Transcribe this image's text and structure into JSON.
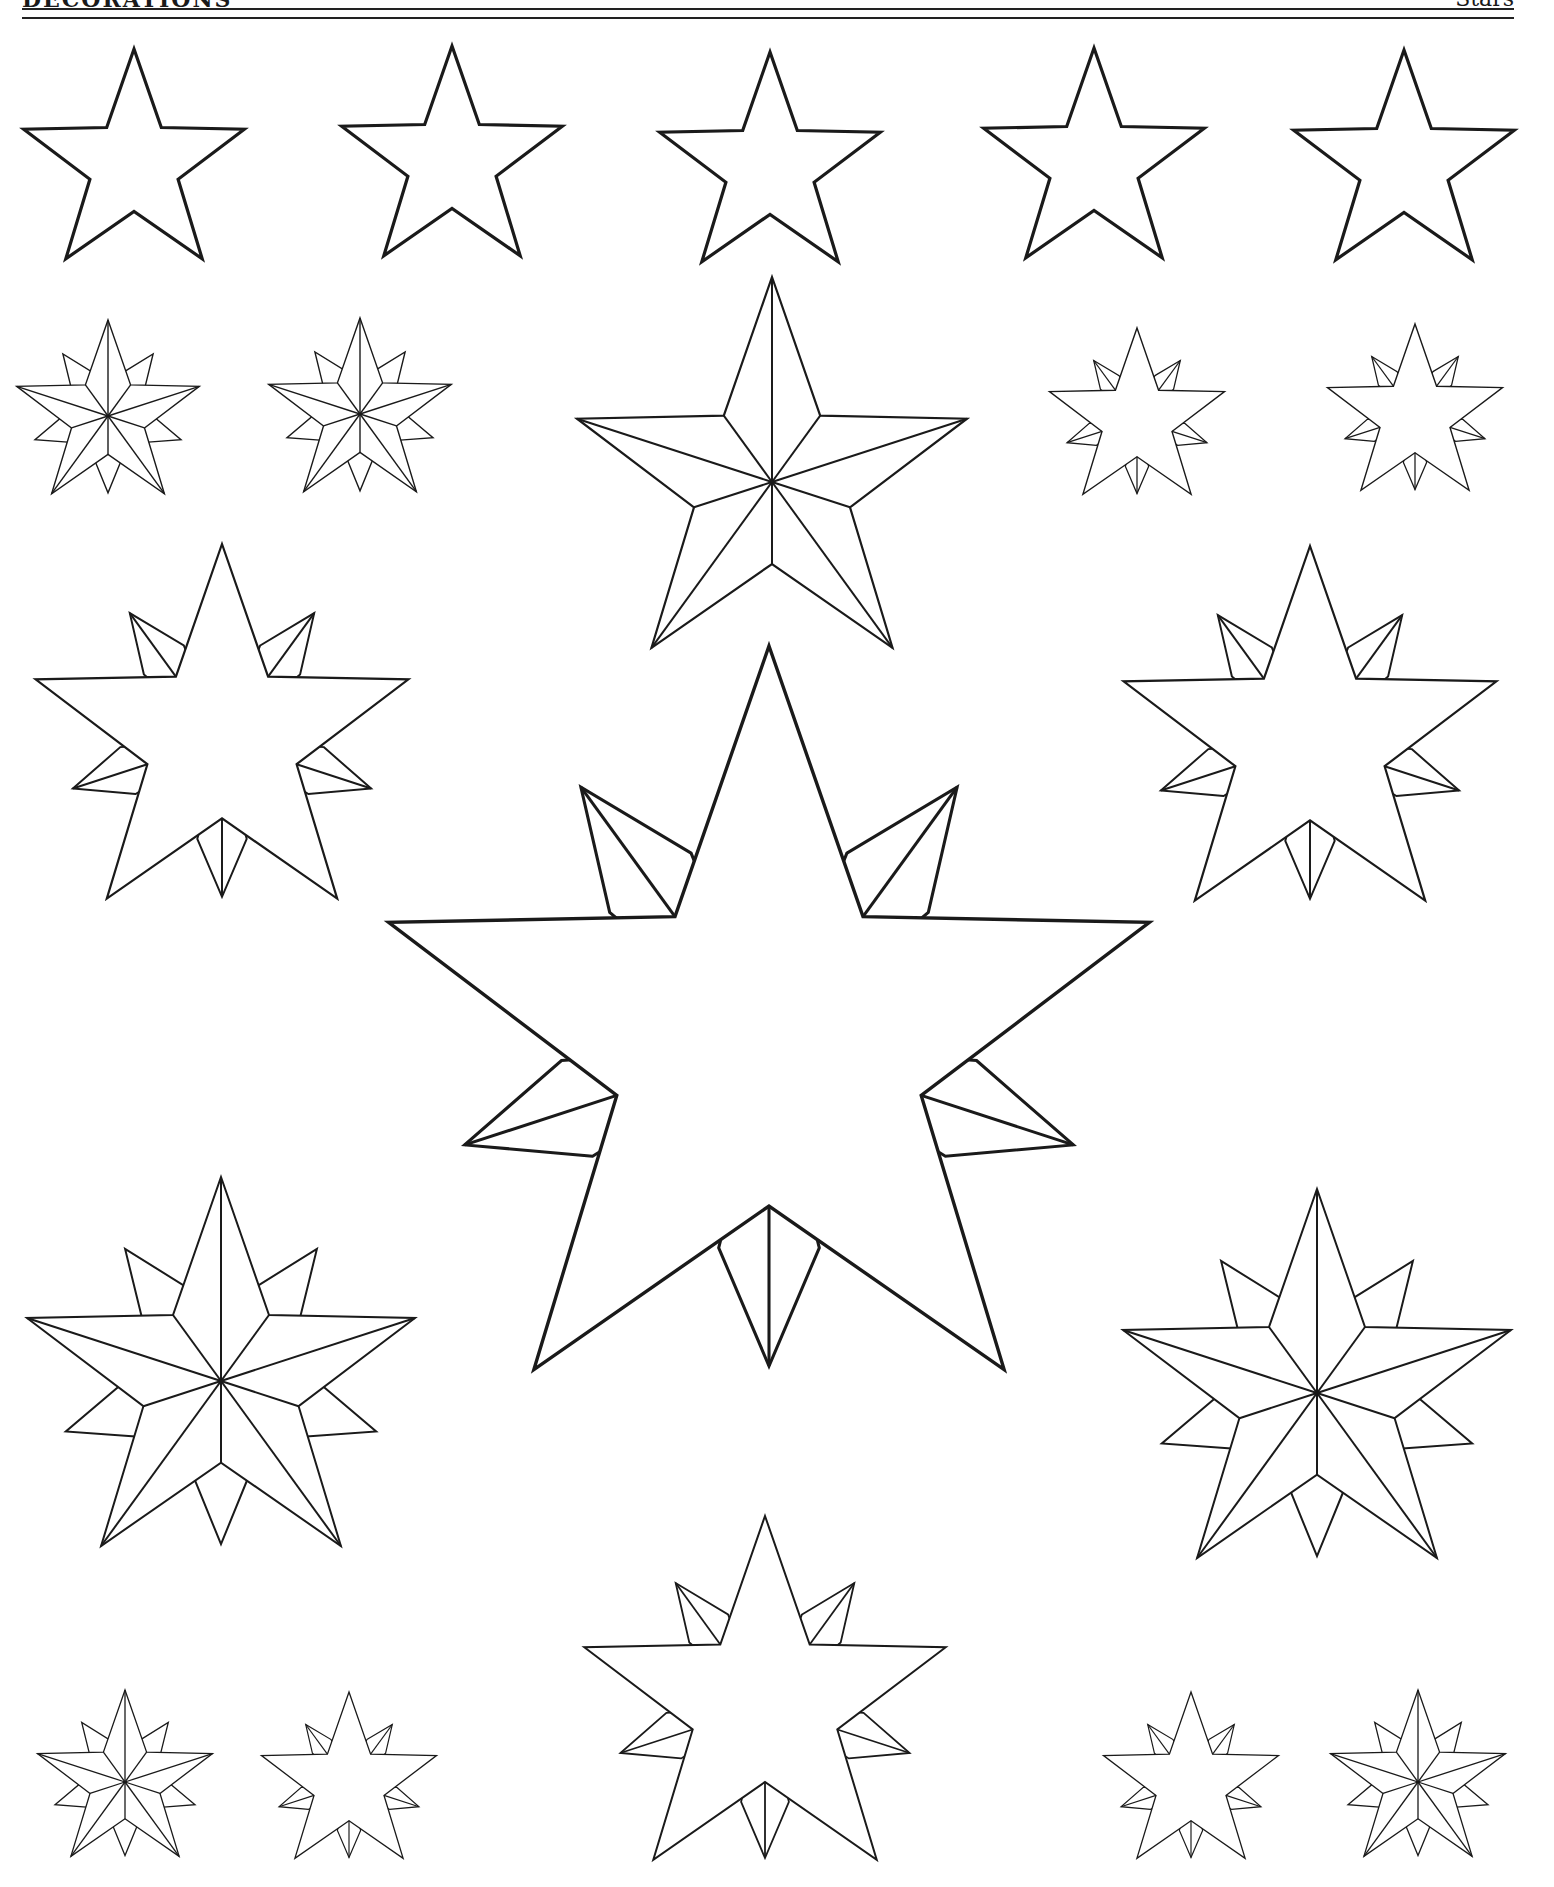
{
  "header": {
    "title": "DECORATIONS",
    "section": "Stars"
  },
  "colors": {
    "ink": "#1a1a1a",
    "paper": "#ffffff"
  },
  "stars": [
    {
      "name": "plain-star-1",
      "type": "plain5",
      "cx": 134,
      "cy": 165,
      "r": 116,
      "stroke": 3.2
    },
    {
      "name": "plain-star-2",
      "type": "plain5",
      "cx": 452,
      "cy": 162,
      "r": 116,
      "stroke": 3.2
    },
    {
      "name": "plain-star-3",
      "type": "plain5",
      "cx": 770,
      "cy": 168,
      "r": 116,
      "stroke": 3.2
    },
    {
      "name": "plain-star-4",
      "type": "plain5",
      "cx": 1094,
      "cy": 164,
      "r": 116,
      "stroke": 3.2
    },
    {
      "name": "plain-star-5",
      "type": "plain5",
      "cx": 1404,
      "cy": 166,
      "r": 116,
      "stroke": 3.2
    },
    {
      "name": "compass-star-small-1",
      "type": "compass",
      "cx": 108,
      "cy": 416,
      "r": 96,
      "stroke": 1.4
    },
    {
      "name": "compass-star-small-2",
      "type": "compass",
      "cx": 360,
      "cy": 414,
      "r": 96,
      "stroke": 1.4
    },
    {
      "name": "faceted-star-large",
      "type": "faceted5",
      "cx": 772,
      "cy": 482,
      "r": 205,
      "stroke": 2.2
    },
    {
      "name": "spiked-star-small-1",
      "type": "spiked",
      "cx": 1137,
      "cy": 420,
      "r": 92,
      "stroke": 1.4
    },
    {
      "name": "spiked-star-small-2",
      "type": "spiked",
      "cx": 1415,
      "cy": 416,
      "r": 92,
      "stroke": 1.4
    },
    {
      "name": "spiked-star-medium-left",
      "type": "spiked",
      "cx": 222,
      "cy": 740,
      "r": 196,
      "stroke": 2.2
    },
    {
      "name": "spiked-star-medium-right",
      "type": "spiked",
      "cx": 1310,
      "cy": 742,
      "r": 196,
      "stroke": 2.2
    },
    {
      "name": "spiked-star-center-large",
      "type": "spiked",
      "cx": 769,
      "cy": 1046,
      "r": 400,
      "stroke": 3.4
    },
    {
      "name": "compass-star-medium-left",
      "type": "compass",
      "cx": 221,
      "cy": 1381,
      "r": 204,
      "stroke": 2.0
    },
    {
      "name": "compass-star-medium-right",
      "type": "compass",
      "cx": 1317,
      "cy": 1393,
      "r": 204,
      "stroke": 2.0
    },
    {
      "name": "spiked-star-bottom-center",
      "type": "spiked",
      "cx": 765,
      "cy": 1706,
      "r": 190,
      "stroke": 2.0
    },
    {
      "name": "compass-star-tiny-1",
      "type": "compass",
      "cx": 125,
      "cy": 1782,
      "r": 92,
      "stroke": 1.3
    },
    {
      "name": "spiked-star-tiny-1",
      "type": "spiked",
      "cx": 349,
      "cy": 1784,
      "r": 92,
      "stroke": 1.3
    },
    {
      "name": "spiked-star-tiny-2",
      "type": "spiked",
      "cx": 1191,
      "cy": 1784,
      "r": 92,
      "stroke": 1.3
    },
    {
      "name": "compass-star-tiny-2",
      "type": "compass",
      "cx": 1418,
      "cy": 1782,
      "r": 92,
      "stroke": 1.3
    }
  ]
}
